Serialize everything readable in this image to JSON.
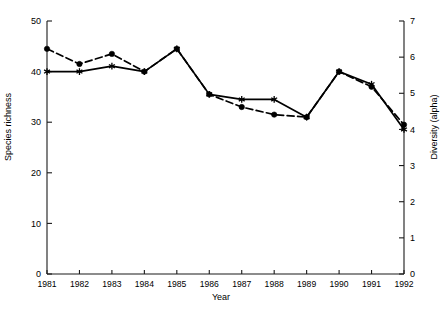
{
  "chart_data": {
    "type": "line",
    "title": "",
    "xlabel": "Year",
    "ylabel": "Species richness",
    "ylabel_right": "Diversity (alpha)",
    "categories": [
      "1981",
      "1982",
      "1983",
      "1984",
      "1985",
      "1986",
      "1987",
      "1988",
      "1989",
      "1990",
      "1991",
      "1992"
    ],
    "x": [
      1981,
      1982,
      1983,
      1984,
      1985,
      1986,
      1987,
      1988,
      1989,
      1990,
      1991,
      1992
    ],
    "ylim": [
      0,
      50
    ],
    "ylim_right": [
      0,
      7
    ],
    "yticks": [
      0,
      10,
      20,
      30,
      40,
      50
    ],
    "yticks_right": [
      0,
      1,
      2,
      3,
      4,
      5,
      6,
      7
    ],
    "grid": false,
    "legend": "none",
    "series": [
      {
        "name": "Species richness",
        "axis": "left",
        "marker": "filled-circle",
        "linestyle": "dashed",
        "color": "#000000",
        "values": [
          44.5,
          41.5,
          43.5,
          40.0,
          44.5,
          35.5,
          33.0,
          31.5,
          31.0,
          40.0,
          37.0,
          29.5
        ]
      },
      {
        "name": "Diversity (alpha)",
        "axis": "right",
        "marker": "asterisk",
        "linestyle": "solid",
        "color": "#000000",
        "values": [
          5.6,
          5.6,
          5.75,
          5.6,
          6.23,
          4.97,
          4.83,
          4.83,
          4.34,
          5.6,
          5.25,
          4.0
        ]
      }
    ]
  },
  "axes": {
    "left_tick_labels": [
      "50",
      "40",
      "30",
      "20",
      "10",
      "0"
    ],
    "right_tick_labels": [
      "7",
      "6",
      "5",
      "4",
      "3",
      "2",
      "1",
      "0"
    ],
    "x_tick_labels": [
      "1981",
      "1982",
      "1983",
      "1984",
      "1985",
      "1986",
      "1987",
      "1988",
      "1989",
      "1990",
      "1991",
      "1992"
    ]
  },
  "labels": {
    "x_axis_title": "Year",
    "y_axis_title_left": "Species richness",
    "y_axis_title_right": "Diversity (alpha)"
  },
  "colors": {
    "axis": "#1a1a1a",
    "series": "#000000",
    "background": "#ffffff"
  }
}
